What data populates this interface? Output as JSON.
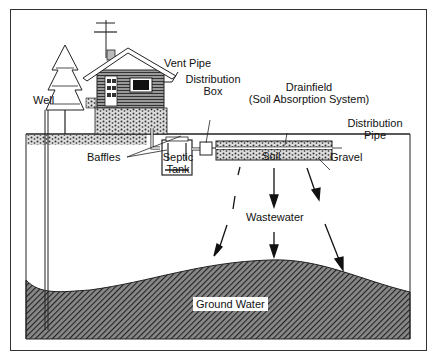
{
  "diagram": {
    "labels": {
      "vent_pipe": "Vent Pipe",
      "distribution_box_1": "Distribution",
      "distribution_box_2": "Box",
      "drainfield_1": "Drainfield",
      "drainfield_2": "(Soil Absorption System)",
      "distribution_pipe_1": "Distribution",
      "distribution_pipe_2": "Pipe",
      "well": "Well",
      "baffles": "Baffles",
      "septic_tank_1": "Septic",
      "septic_tank_2": "Tank",
      "soil": "Soil",
      "gravel": "Gravel",
      "wastewater": "Wastewater",
      "ground_water": "Ground Water"
    },
    "colors": {
      "ink": "#111111",
      "frame": "#333333",
      "groundwater_fill": "#444444"
    }
  }
}
